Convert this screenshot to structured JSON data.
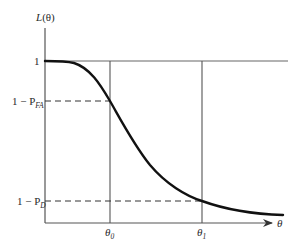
{
  "diagram": {
    "type": "operating-characteristic-curve",
    "y_axis": {
      "label_main": "L",
      "label_arg": "(θ)",
      "ticks": [
        {
          "label": "1",
          "y": 61
        },
        {
          "label_prefix": "1 − P",
          "label_sub": "FA",
          "y": 101
        },
        {
          "label_prefix": "1 − P",
          "label_sub": "D",
          "y": 201
        }
      ]
    },
    "x_axis": {
      "label": "θ",
      "ticks": [
        {
          "label_main": "θ",
          "label_sub": "0",
          "x": 110
        },
        {
          "label_main": "θ",
          "label_sub": "1",
          "x": 202
        }
      ]
    },
    "curve": {
      "description": "Decreasing S-shaped curve from L=1 through (θ0, 1−P_FA) and (θ1, 1−P_D), leveling off near zero",
      "points": [
        [
          45,
          61
        ],
        [
          65,
          62
        ],
        [
          85,
          72
        ],
        [
          110,
          101
        ],
        [
          133,
          140
        ],
        [
          150,
          165
        ],
        [
          175,
          188
        ],
        [
          202,
          201
        ],
        [
          230,
          210
        ],
        [
          260,
          214
        ],
        [
          283,
          215
        ]
      ]
    },
    "colors": {
      "axis": "#555555",
      "curve": "#111111",
      "dashed": "#333333"
    }
  }
}
